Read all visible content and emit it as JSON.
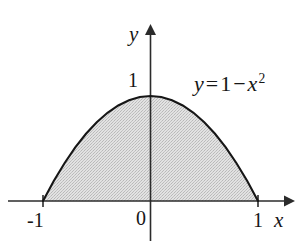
{
  "figure": {
    "kind": "cartesian-plot",
    "background_color": "#ffffff",
    "ink_color": "#161616",
    "fill_color": "#d8d8d8",
    "fill_pattern": "stipple-halftone"
  },
  "axes": {
    "x_axis": {
      "label": "x",
      "has_arrow": true,
      "tick_labels": [
        "-1",
        "0",
        "1"
      ]
    },
    "y_axis": {
      "label": "y",
      "has_arrow": true,
      "tick_labels": [
        "1"
      ]
    },
    "origin_label": "0"
  },
  "annotations": {
    "curve_equation": {
      "lhs": "y",
      "equals": "=",
      "constant": "1",
      "minus": "−",
      "variable": "x",
      "exponent": "2",
      "plain_text": "y = 1 − x²"
    }
  },
  "chart_data": {
    "type": "line",
    "title": "",
    "xlabel": "x",
    "ylabel": "y",
    "xlim": [
      -1.33,
      1.55
    ],
    "ylim": [
      -0.38,
      1.66
    ],
    "grid": false,
    "legend": null,
    "series": [
      {
        "name": "y = 1 - x^2",
        "equation": "y = 1 - x^2",
        "shaded_region": true,
        "shaded_between": [
          "curve",
          "y = 0"
        ],
        "shade_domain": [
          -1,
          1
        ],
        "x": [
          -1,
          -0.9,
          -0.8,
          -0.7,
          -0.6,
          -0.5,
          -0.4,
          -0.3,
          -0.2,
          -0.1,
          0,
          0.1,
          0.2,
          0.3,
          0.4,
          0.5,
          0.6,
          0.7,
          0.8,
          0.9,
          1
        ],
        "values": [
          0,
          0.19,
          0.36,
          0.51,
          0.64,
          0.75,
          0.84,
          0.91,
          0.96,
          0.99,
          1,
          0.99,
          0.96,
          0.91,
          0.84,
          0.75,
          0.64,
          0.51,
          0.36,
          0.19,
          0
        ]
      }
    ],
    "x_ticks": [
      -1,
      0,
      1
    ],
    "x_tick_labels": [
      "-1",
      "0",
      "1"
    ],
    "y_ticks": [
      1
    ],
    "y_tick_labels": [
      "1"
    ],
    "roots": [
      -1,
      1
    ],
    "vertex": [
      0,
      1
    ]
  }
}
